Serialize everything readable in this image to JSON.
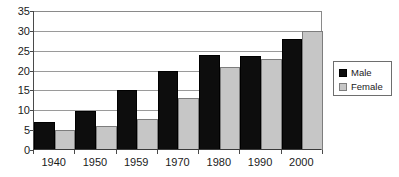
{
  "chart_data": {
    "type": "bar",
    "title": "",
    "subtitle": "",
    "xlabel": "",
    "ylabel": "",
    "categories": [
      "1940",
      "1950",
      "1959",
      "1970",
      "1980",
      "1990",
      "2000"
    ],
    "series": [
      {
        "name": "Male",
        "color": "#0d0d0d",
        "values": [
          7,
          9.7,
          15,
          20,
          24,
          23.7,
          28
        ]
      },
      {
        "name": "Female",
        "color": "#c6c6c6",
        "values": [
          5,
          6,
          7.8,
          13,
          21,
          23,
          30
        ]
      }
    ],
    "ylim": [
      0,
      35
    ],
    "ytick_values": [
      0,
      5,
      10,
      15,
      20,
      25,
      30,
      35
    ],
    "ytick_labels": [
      "0",
      "5",
      "10",
      "15",
      "20",
      "25",
      "30",
      "35"
    ],
    "grid": true,
    "legend_position": "right",
    "legend_entries": [
      {
        "label": "Male",
        "swatch": "male-swatch"
      },
      {
        "label": "Female",
        "swatch": "female-swatch"
      }
    ]
  },
  "colors": {
    "male": "#0d0d0d",
    "female": "#c6c6c6",
    "gridline": "#9a9a9a",
    "axis": "#3a3a3a",
    "text": "#1a1a1a",
    "background": "#ffffff"
  }
}
